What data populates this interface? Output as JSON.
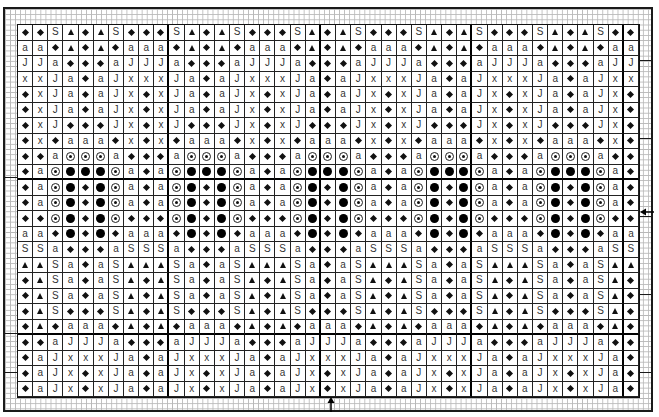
{
  "chart": {
    "columns": 41,
    "rows": 24,
    "repeat_width": 8,
    "symbols": {
      "D": {
        "name": "diamond-icon",
        "glyph": "◆"
      },
      "T": {
        "name": "triangle-icon",
        "glyph": "▲"
      },
      "S": {
        "name": "letter-s-symbol",
        "glyph": "S"
      },
      "a": {
        "name": "letter-a-symbol",
        "glyph": "a"
      },
      "J": {
        "name": "letter-j-symbol",
        "glyph": "J"
      },
      "x": {
        "name": "letter-x-symbol",
        "glyph": "x"
      },
      "O": {
        "name": "circled-dot-icon",
        "glyph": "⊙"
      },
      "B": {
        "name": "filled-circle-icon",
        "glyph": "●"
      }
    },
    "row_repeats": [
      "DDSTDTSD",
      "aaDTDTDa",
      "JJaDDDaJ",
      "xxJaDaJx",
      "DxJaDaJx",
      "DxJaDaJx",
      "DxJDDDJx",
      "DxDaaaDx",
      "DDaOOOaD",
      "DaOBBBOa",
      "DaOBDBOa",
      "DaOBDBOa",
      "DDOBDBOD",
      "aaDBDBDa",
      "SSaDDDaS",
      "TTSaDaST",
      "DTSaDaST",
      "DTSaDaST",
      "DTSDDDST",
      "DTDaaaDT",
      "DDaJJJaD",
      "DaJxxxJa",
      "DaJxDxJa",
      "DaJxDxJa"
    ],
    "center_markers": {
      "bottom_arrow": "↑",
      "right_arrow": "←"
    }
  }
}
